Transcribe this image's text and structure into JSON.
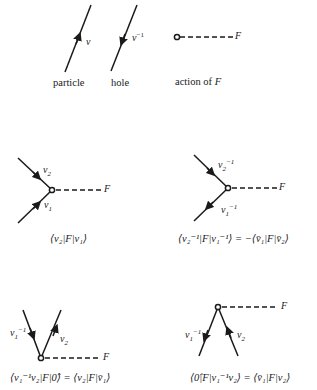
{
  "legend": {
    "particle": {
      "symbol": "v",
      "caption": "particle"
    },
    "hole": {
      "symbol": "v",
      "superscript": "−1",
      "caption": "hole"
    },
    "action": {
      "symbol": "F",
      "caption_prefix": "action of ",
      "caption_symbol": "F"
    }
  },
  "diagrams": [
    {
      "id": "particle-scattering",
      "labels": {
        "upper": "v",
        "upper_sub": "2",
        "lower": "v",
        "lower_sub": "1",
        "operator": "F"
      },
      "caption": "⟨v₂|F|v₁⟩"
    },
    {
      "id": "hole-scattering",
      "labels": {
        "upper": "v",
        "upper_sub": "2",
        "upper_sup": "−1",
        "lower": "v",
        "lower_sub": "1",
        "lower_sup": "−1",
        "operator": "F"
      },
      "caption": "⟨v₂⁻¹|F|v₁⁻¹⟩ = −⟨v̄₁|F|v̄₂⟩"
    },
    {
      "id": "pair-creation",
      "labels": {
        "left": "v",
        "left_sub": "1",
        "left_sup": "−1",
        "right": "v",
        "right_sub": "2",
        "operator": "F"
      },
      "caption": "⟨v₁⁻¹v₂|F|0̂⟩ = ⟨v₂|F|v̄₁⟩"
    },
    {
      "id": "pair-annihilation",
      "labels": {
        "left": "v",
        "left_sub": "1",
        "left_sup": "−1",
        "right": "v",
        "right_sub": "2",
        "operator": "F"
      },
      "caption": "⟨0̂|F|v₁⁻¹v₂⟩ = ⟨v̄₁|F|v₂⟩"
    }
  ],
  "colors": {
    "line": "#1a1a1a",
    "background": "#ffffff"
  }
}
